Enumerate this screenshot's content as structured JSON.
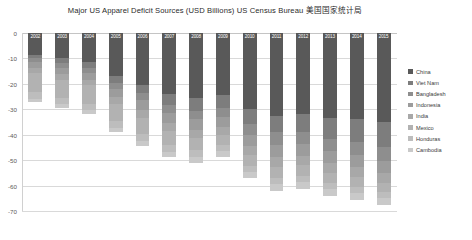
{
  "chart_data": {
    "type": "bar",
    "stacked": true,
    "orientation": "vertical",
    "title": "Major US Apparel Deficit Sources (USD Billions) US Census Bureau 美国国家统计局",
    "xlabel": "",
    "ylabel": "",
    "ylim": [
      -70,
      0
    ],
    "grid": true,
    "legend_position": "right",
    "ytick_labels": [
      "0",
      "-10",
      "-20",
      "-30",
      "-40",
      "-50",
      "-60",
      "-70"
    ],
    "ytick_values": [
      0,
      -10,
      -20,
      -30,
      -40,
      -50,
      -60,
      -70
    ],
    "categories": [
      "2002",
      "2003",
      "2004",
      "2005",
      "2006",
      "2007",
      "2008",
      "2009",
      "2010",
      "2011",
      "2012",
      "2013",
      "2014",
      "2015"
    ],
    "series": [
      {
        "name": "China",
        "color": "#595959",
        "values": [
          -8.5,
          -10.0,
          -11.5,
          -17.0,
          -20.5,
          -24.0,
          -25.5,
          -24.5,
          -30.0,
          -32.5,
          -32.0,
          -33.5,
          -34.0,
          -35.0
        ]
      },
      {
        "name": "Viet Nam",
        "color": "#7d7d7d",
        "values": [
          -1.2,
          -1.8,
          -2.3,
          -2.7,
          -3.2,
          -4.2,
          -5.0,
          -5.0,
          -5.8,
          -6.6,
          -7.0,
          -8.0,
          -9.0,
          -10.0
        ]
      },
      {
        "name": "Bangladesh",
        "color": "#8e8e8e",
        "values": [
          -1.9,
          -2.0,
          -2.0,
          -2.3,
          -2.8,
          -3.1,
          -3.5,
          -3.6,
          -4.2,
          -4.8,
          -4.7,
          -5.0,
          -5.1,
          -5.3
        ]
      },
      {
        "name": "Indonesia",
        "color": "#9c9c9c",
        "values": [
          -2.3,
          -2.4,
          -2.5,
          -3.0,
          -3.8,
          -4.0,
          -4.2,
          -3.9,
          -4.5,
          -5.0,
          -4.7,
          -4.8,
          -4.7,
          -4.6
        ]
      },
      {
        "name": "India",
        "color": "#a8a8a8",
        "values": [
          -2.0,
          -2.2,
          -2.3,
          -3.0,
          -3.2,
          -3.2,
          -3.2,
          -3.0,
          -3.5,
          -3.8,
          -3.6,
          -3.8,
          -3.9,
          -4.0
        ]
      },
      {
        "name": "Mexico",
        "color": "#b2b2b2",
        "values": [
          -7.4,
          -7.3,
          -7.2,
          -6.8,
          -6.3,
          -5.6,
          -4.8,
          -4.2,
          -4.3,
          -4.2,
          -4.1,
          -3.9,
          -3.7,
          -3.6
        ]
      },
      {
        "name": "Honduras",
        "color": "#bdbdbd",
        "values": [
          -2.5,
          -2.4,
          -2.5,
          -2.5,
          -2.6,
          -2.7,
          -2.6,
          -2.3,
          -2.5,
          -2.6,
          -2.6,
          -2.5,
          -2.4,
          -2.3
        ]
      },
      {
        "name": "Cambodia",
        "color": "#c9c9c9",
        "values": [
          -1.2,
          -1.4,
          -1.5,
          -1.7,
          -1.9,
          -2.0,
          -2.2,
          -2.1,
          -2.4,
          -2.6,
          -2.6,
          -2.7,
          -2.8,
          -2.9
        ]
      }
    ],
    "totals": [
      -27.0,
      -29.5,
      -31.8,
      -39.0,
      -44.3,
      -48.8,
      -51.0,
      -48.6,
      -57.2,
      -62.1,
      -61.3,
      -64.2,
      -65.6,
      -67.7
    ]
  }
}
